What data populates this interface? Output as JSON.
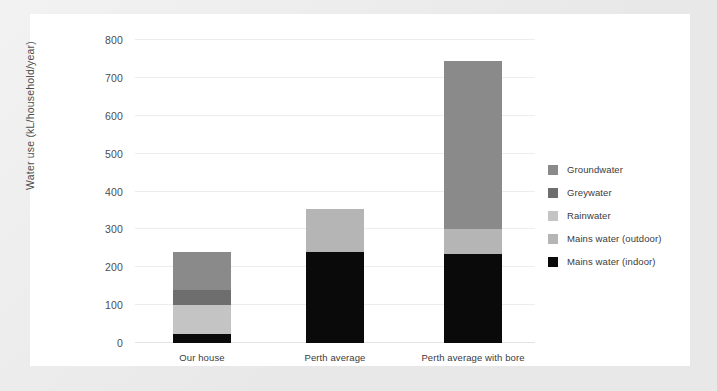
{
  "theme": {
    "backdrop_color": "#e8e8e8",
    "card_color": "#ffffff",
    "gridline_color": "#ededed",
    "text_color": "#3b3b3b",
    "axis_text_color": "#4d4d4d"
  },
  "chart_data": {
    "type": "bar",
    "stacked": true,
    "title": "",
    "xlabel": "",
    "ylabel": "Water use (kL/household/year)",
    "ylim": [
      0,
      800
    ],
    "yticks": [
      0,
      100,
      200,
      300,
      400,
      500,
      600,
      700,
      800
    ],
    "ytick_labels": [
      "0",
      "100",
      "200",
      "300",
      "400",
      "500",
      "600",
      "700",
      "800"
    ],
    "grid": true,
    "legend_position": "right",
    "categories": [
      "Our house",
      "Perth average",
      "Perth average with bore"
    ],
    "series": [
      {
        "name": "Mains water (indoor)",
        "color": "#0a0a0a",
        "values": [
          25,
          240,
          235
        ]
      },
      {
        "name": "Mains water (outdoor)",
        "color": "#b5b5b5",
        "values": [
          0,
          115,
          65
        ]
      },
      {
        "name": "Rainwater",
        "color": "#c4c4c4",
        "values": [
          75,
          0,
          0
        ]
      },
      {
        "name": "Greywater",
        "color": "#6e6e6e",
        "values": [
          40,
          0,
          0
        ]
      },
      {
        "name": "Groundwater",
        "color": "#8a8a8a",
        "values": [
          100,
          0,
          445
        ]
      }
    ],
    "totals": [
      240,
      355,
      745
    ],
    "legend_order": [
      "Groundwater",
      "Greywater",
      "Rainwater",
      "Mains water (outdoor)",
      "Mains water (indoor)"
    ]
  },
  "legend": {
    "items": [
      {
        "label": "Groundwater",
        "color": "#8a8a8a",
        "swatch_icon": "legend-swatch-icon"
      },
      {
        "label": "Greywater",
        "color": "#6e6e6e",
        "swatch_icon": "legend-swatch-icon"
      },
      {
        "label": "Rainwater",
        "color": "#c4c4c4",
        "swatch_icon": "legend-swatch-icon"
      },
      {
        "label": "Mains water (outdoor)",
        "color": "#b5b5b5",
        "swatch_icon": "legend-swatch-icon"
      },
      {
        "label": "Mains water (indoor)",
        "color": "#0a0a0a",
        "swatch_icon": "legend-swatch-icon"
      }
    ]
  }
}
